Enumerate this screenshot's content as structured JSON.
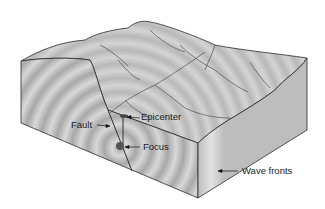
{
  "diagram": {
    "labels": {
      "fault": "Fault",
      "epicenter": "Epicenter",
      "focus": "Focus",
      "wave_fronts": "Wave fronts"
    },
    "colors": {
      "block_light": "#d6d6d6",
      "block_mid": "#b3b3b3",
      "block_dark": "#8f8f8f",
      "outline": "#2a2a2a",
      "focus": "#555555"
    }
  }
}
